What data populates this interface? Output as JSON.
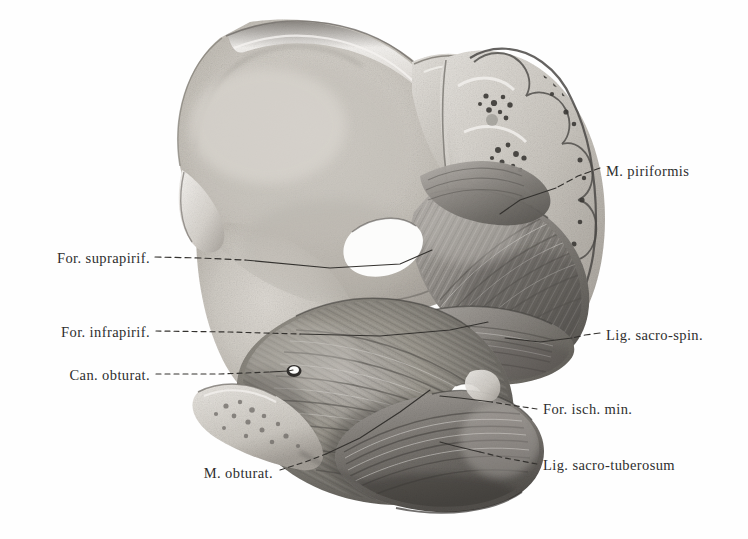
{
  "figure": {
    "kind": "anatomical-illustration",
    "style": "monochrome halftone lithograph",
    "background_color": "#fefefe",
    "ink_color": "#2e2e2e",
    "bone_light": "#e8e6e2",
    "bone_mid": "#c9c5bf",
    "muscle_mid": "#9e9a95",
    "muscle_dark": "#6d6a66"
  },
  "labels": [
    {
      "id": "m-piriformis",
      "text": "M. piriformis",
      "side": "right",
      "x": 606,
      "y": 172
    },
    {
      "id": "for-suprapirif",
      "text": "For. suprapirif.",
      "side": "left",
      "x": 150,
      "y": 259
    },
    {
      "id": "for-infrapirif",
      "text": "For. infrapirif.",
      "side": "left",
      "x": 150,
      "y": 333
    },
    {
      "id": "can-obturat",
      "text": "Can. obturat.",
      "side": "left",
      "x": 150,
      "y": 376
    },
    {
      "id": "lig-sacro-spin",
      "text": "Lig. sacro-spin.",
      "side": "right",
      "x": 606,
      "y": 336
    },
    {
      "id": "for-isch-min",
      "text": "For. isch. min.",
      "side": "right",
      "x": 543,
      "y": 410
    },
    {
      "id": "lig-sacro-tuberosum",
      "text": "Lig. sacro-tuberosum",
      "side": "right",
      "x": 543,
      "y": 466
    },
    {
      "id": "m-obturat",
      "text": "M. obturat.",
      "side": "left",
      "x": 273,
      "y": 474
    }
  ],
  "leaders": [
    {
      "id": "leader-m-piriformis",
      "dash": "6,4",
      "points": "600,168 578,176 556,188"
    },
    {
      "id": "leader-m-piriformis-solid",
      "dash": "0",
      "points": "556,188 520,200 500,214"
    },
    {
      "id": "leader-for-suprapirif",
      "dash": "6,4",
      "points": "155,257 200,258 245,260"
    },
    {
      "id": "leader-for-suprapirif-solid",
      "dash": "0",
      "points": "245,260 330,268 400,264 432,250"
    },
    {
      "id": "leader-for-infrapirif",
      "dash": "5,4",
      "points": "156,331 230,332 300,334"
    },
    {
      "id": "leader-for-infrapirif-solid",
      "dash": "0",
      "points": "300,334 380,336 450,330 488,322"
    },
    {
      "id": "leader-can-obturat",
      "dash": "5,4",
      "points": "156,374 220,374 270,372"
    },
    {
      "id": "leader-can-obturat-solid",
      "dash": "0",
      "points": "270,372 288,371 294,370"
    },
    {
      "id": "leader-lig-sacro-spin",
      "dash": "6,4",
      "points": "600,333 585,335 572,338"
    },
    {
      "id": "leader-lig-sacro-spin-solid",
      "dash": "0",
      "points": "572,338 540,342 505,338"
    },
    {
      "id": "leader-for-isch-min",
      "dash": "5,4",
      "points": "537,409 510,405 492,402"
    },
    {
      "id": "leader-for-isch-min-solid",
      "dash": "0",
      "points": "492,402 460,398 438,396"
    },
    {
      "id": "leader-lig-sacro-tuberosum",
      "dash": "5,4",
      "points": "537,464 505,458 480,452"
    },
    {
      "id": "leader-lig-sacro-tub-solid",
      "dash": "0",
      "points": "480,452 455,446 440,442"
    },
    {
      "id": "leader-m-obturat",
      "dash": "5,4",
      "points": "280,470 305,462 326,454"
    },
    {
      "id": "leader-m-obturat-solid",
      "dash": "0",
      "points": "326,454 360,438 400,412 430,390"
    }
  ],
  "structures": [
    {
      "id": "ilium-wing",
      "name": "Iliac wing / iliac fossa"
    },
    {
      "id": "iliac-crest",
      "name": "Iliac crest"
    },
    {
      "id": "sacrum-sectioned",
      "name": "Sacrum, sagittally sectioned"
    },
    {
      "id": "sacral-cancellous",
      "name": "Cancellous bone of sacral bodies"
    },
    {
      "id": "piriformis",
      "name": "Piriformis muscle"
    },
    {
      "id": "obturator-internus",
      "name": "Obturator internus muscle"
    },
    {
      "id": "sacrospinous-ligament",
      "name": "Sacrospinous ligament"
    },
    {
      "id": "sacrotuberous-ligament",
      "name": "Sacrotuberous ligament"
    },
    {
      "id": "suprapiriform-foramen",
      "name": "Suprapiriform foramen"
    },
    {
      "id": "infrapiriform-foramen",
      "name": "Infrapiriform foramen"
    },
    {
      "id": "lesser-sciatic-foramen",
      "name": "Lesser sciatic foramen"
    },
    {
      "id": "obturator-canal",
      "name": "Obturator canal"
    },
    {
      "id": "pubis-cut",
      "name": "Cut surface of pubis"
    }
  ]
}
